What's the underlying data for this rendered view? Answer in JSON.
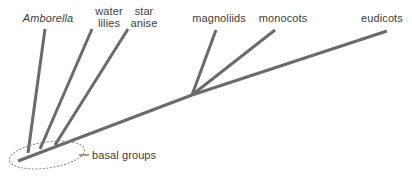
{
  "diagram": {
    "type": "phylogenetic-tree",
    "title": "",
    "background_color": "#ffffff",
    "line_color": "#6b6b6b",
    "text_color": "#3d3d3d",
    "line_width": 3,
    "tips": [
      {
        "id": "amborella",
        "label": "Amborella",
        "style": "italic",
        "label_x": 13,
        "label_y": 12,
        "label_width": 70,
        "branch": {
          "x1": 28,
          "y1": 153,
          "x2": 45,
          "y2": 29
        }
      },
      {
        "id": "water-lilies",
        "label": "water\nlilies",
        "style": "normal",
        "label_x": 88,
        "label_y": 5,
        "label_width": 42,
        "branch": {
          "x1": 40,
          "y1": 149,
          "x2": 92,
          "y2": 29
        }
      },
      {
        "id": "star-anise",
        "label": "star\nanise",
        "style": "normal",
        "label_x": 123,
        "label_y": 5,
        "label_width": 42,
        "branch": {
          "x1": 55,
          "y1": 145,
          "x2": 128,
          "y2": 29
        }
      },
      {
        "id": "magnoliids",
        "label": "magnoliids",
        "style": "normal",
        "label_x": 189,
        "label_y": 12,
        "label_width": 60,
        "branch": {
          "x1": 192,
          "y1": 95,
          "x2": 216,
          "y2": 30
        }
      },
      {
        "id": "monocots",
        "label": "monocots",
        "style": "normal",
        "label_x": 256,
        "label_y": 12,
        "label_width": 54,
        "branch": {
          "x1": 192,
          "y1": 95,
          "x2": 275,
          "y2": 30
        }
      },
      {
        "id": "eudicots",
        "label": "eudicots",
        "style": "normal",
        "label_x": 357,
        "label_y": 12,
        "label_width": 50,
        "branch": {
          "x1": 192,
          "y1": 95,
          "x2": 387,
          "y2": 31
        }
      }
    ],
    "trunk": {
      "x1": 18,
      "y1": 161,
      "x2": 192,
      "y2": 95
    },
    "annotation": {
      "id": "basal-groups",
      "label": "basal groups",
      "label_x": 92,
      "label_y": 149,
      "leader": {
        "x1": 79,
        "y1": 155,
        "x2": 89,
        "y2": 155
      },
      "ellipse": {
        "cx": 47,
        "cy": 155,
        "rx": 38,
        "ry": 13,
        "rotation": -8,
        "stroke_style": "dotted"
      }
    }
  }
}
